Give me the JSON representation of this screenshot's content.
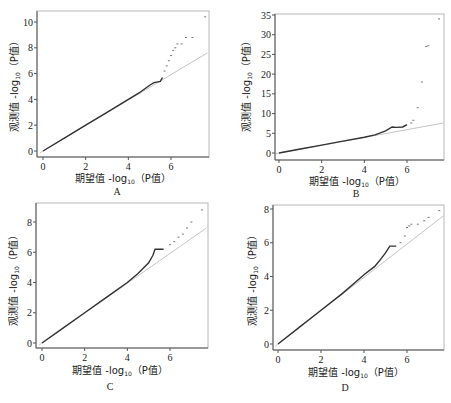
{
  "chart_data": [
    {
      "type": "scatter",
      "panel": "A",
      "caption": "A",
      "xlabel": "期望值 -log10（P值）",
      "ylabel": "观测值 -log10（P值）",
      "xticks": [
        0,
        2,
        4,
        6
      ],
      "yticks": [
        0,
        2,
        4,
        6,
        8,
        10
      ],
      "xlim": [
        -0.2,
        7.7
      ],
      "ylim": [
        -0.3,
        10.8
      ],
      "reference_line": {
        "x": [
          0,
          7.7
        ],
        "y": [
          0,
          7.6
        ]
      },
      "series": [
        {
          "name": "observed",
          "x": [
            0,
            1,
            2,
            3,
            4,
            4.5,
            5.0,
            5.2,
            5.5,
            5.6,
            5.7,
            5.8,
            5.9,
            6.0,
            6.1,
            6.2,
            6.3,
            6.5,
            6.7,
            7.0,
            7.6
          ],
          "y": [
            0,
            1,
            2,
            3,
            4,
            4.5,
            5.1,
            5.3,
            5.4,
            5.7,
            6.2,
            6.6,
            7.0,
            7.4,
            7.8,
            8.0,
            8.3,
            8.3,
            8.8,
            8.8,
            10.4
          ]
        }
      ]
    },
    {
      "type": "scatter",
      "panel": "B",
      "caption": "B",
      "xlabel": "期望值 -log10（P值）",
      "ylabel": "观测值 -log10（P值）",
      "xticks": [
        0,
        2,
        4,
        6
      ],
      "yticks": [
        0,
        5,
        10,
        15,
        20,
        25,
        30,
        35
      ],
      "xlim": [
        -0.2,
        7.7
      ],
      "ylim": [
        -1,
        35.5
      ],
      "reference_line": {
        "x": [
          0,
          7.7
        ],
        "y": [
          0,
          7.6
        ]
      },
      "series": [
        {
          "name": "observed",
          "x": [
            0,
            1,
            2,
            3,
            4,
            4.5,
            5.0,
            5.3,
            5.5,
            5.8,
            6.0,
            6.2,
            6.3,
            6.5,
            6.7,
            6.9,
            7.0,
            7.5
          ],
          "y": [
            0,
            1,
            2,
            3,
            4,
            4.6,
            5.6,
            6.6,
            6.5,
            6.6,
            7.2,
            7.6,
            8.3,
            11.5,
            18,
            27,
            27.2,
            34
          ]
        }
      ]
    },
    {
      "type": "scatter",
      "panel": "C",
      "caption": "C",
      "xlabel": "期望值 -log10（P值）",
      "ylabel": "观测值 -log10（P值）",
      "xticks": [
        0,
        2,
        4,
        6
      ],
      "yticks": [
        0,
        2,
        4,
        6,
        8
      ],
      "xlim": [
        -0.2,
        7.7
      ],
      "ylim": [
        -0.3,
        9.2
      ],
      "reference_line": {
        "x": [
          0,
          7.7
        ],
        "y": [
          0,
          7.6
        ]
      },
      "series": [
        {
          "name": "observed",
          "x": [
            0,
            1,
            2,
            3,
            4,
            4.5,
            5.0,
            5.2,
            5.3,
            5.5,
            5.7,
            6.0,
            6.2,
            6.4,
            6.6,
            6.8,
            7.0,
            7.5
          ],
          "y": [
            0,
            1,
            2,
            3,
            4,
            4.6,
            5.3,
            5.8,
            6.2,
            6.2,
            6.2,
            6.5,
            6.7,
            7.0,
            7.2,
            7.6,
            8.0,
            8.8
          ]
        }
      ]
    },
    {
      "type": "scatter",
      "panel": "D",
      "caption": "D",
      "xlabel": "期望值 -log10（P值）",
      "ylabel": "观测值 -log10（P值）",
      "xticks": [
        0,
        2,
        4,
        6
      ],
      "yticks": [
        0,
        2,
        4,
        6,
        8
      ],
      "xlim": [
        -0.2,
        7.7
      ],
      "ylim": [
        -0.3,
        8.3
      ],
      "reference_line": {
        "x": [
          0,
          7.7
        ],
        "y": [
          0,
          7.6
        ]
      },
      "series": [
        {
          "name": "observed",
          "x": [
            0,
            1,
            2,
            3,
            4,
            4.5,
            4.7,
            5.0,
            5.2,
            5.5,
            5.7,
            5.9,
            6.0,
            6.1,
            6.2,
            6.5,
            6.8,
            7.0,
            7.5
          ],
          "y": [
            0,
            1,
            2,
            3,
            4.1,
            4.6,
            4.9,
            5.4,
            5.8,
            5.8,
            6.0,
            6.4,
            6.9,
            7.0,
            7.1,
            7.1,
            7.3,
            7.5,
            7.9
          ]
        }
      ]
    }
  ],
  "panels": {
    "A": {
      "caption": "A",
      "xlabel_main": "期望值 -log",
      "xlabel_sub": "10",
      "xlabel_tail": "（P值）",
      "ylabel_main": "观测值 -log",
      "ylabel_sub": "10",
      "ylabel_tail": "（P值）",
      "yticks": [
        "0",
        "2",
        "4",
        "6",
        "8",
        "10"
      ],
      "xticks": [
        "0",
        "2",
        "4",
        "6"
      ]
    },
    "B": {
      "caption": "B",
      "xlabel_main": "期望值 -log",
      "xlabel_sub": "10",
      "xlabel_tail": "（P值）",
      "ylabel_main": "观测值 -log",
      "ylabel_sub": "10",
      "ylabel_tail": "（P值）",
      "yticks": [
        "0",
        "5",
        "10",
        "15",
        "20",
        "25",
        "30",
        "35"
      ],
      "xticks": [
        "0",
        "2",
        "4",
        "6"
      ]
    },
    "C": {
      "caption": "C",
      "xlabel_main": "期望值 -log",
      "xlabel_sub": "10",
      "xlabel_tail": "（P值）",
      "ylabel_main": "观测值 -log",
      "ylabel_sub": "10",
      "ylabel_tail": "（P值）",
      "yticks": [
        "0",
        "2",
        "4",
        "6",
        "8"
      ],
      "xticks": [
        "0",
        "2",
        "4",
        "6"
      ]
    },
    "D": {
      "caption": "D",
      "xlabel_main": "期望值 -log",
      "xlabel_sub": "10",
      "xlabel_tail": "（P值）",
      "ylabel_main": "观测值 -log",
      "ylabel_sub": "10",
      "ylabel_tail": "（P值）",
      "yticks": [
        "0",
        "2",
        "4",
        "6",
        "8"
      ],
      "xticks": [
        "0",
        "2",
        "4",
        "6"
      ]
    }
  },
  "colors": {
    "frame": "#b8b8b8",
    "axis": "#555555",
    "observed": "#333333",
    "reference": "#c4c4c4"
  }
}
